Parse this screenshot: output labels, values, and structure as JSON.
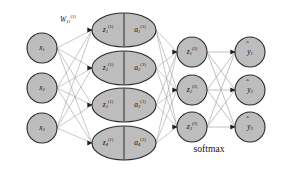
{
  "figure": {
    "type": "neural-network-diagram",
    "title": "",
    "annotations": {
      "weight_label": {
        "base": "W",
        "subscript": "11",
        "superscript": "(1)",
        "full": "W₁₁⁽¹⁾"
      },
      "softmax_label": "softmax"
    },
    "layers": [
      {
        "id": "input",
        "name": "input-layer",
        "shape": "circle",
        "nodes": [
          {
            "id": "x1",
            "base": "x",
            "subscript": "1",
            "superscript": "",
            "cx": 42,
            "cy": 48,
            "r": 15
          },
          {
            "id": "x2",
            "base": "x",
            "subscript": "2",
            "superscript": "",
            "cx": 42,
            "cy": 88,
            "r": 15
          },
          {
            "id": "x3",
            "base": "x",
            "subscript": "3",
            "superscript": "",
            "cx": 42,
            "cy": 128,
            "r": 15
          }
        ]
      },
      {
        "id": "hidden1",
        "name": "hidden-layer-1",
        "shape": "split-ellipse",
        "nodes": [
          {
            "id": "h1",
            "left_base": "z",
            "left_subscript": "1",
            "left_superscript": "(1)",
            "right_base": "a",
            "right_subscript": "1",
            "right_superscript": "(1)",
            "cx": 124,
            "cy": 30,
            "rx": 32,
            "ry": 17
          },
          {
            "id": "h2",
            "left_base": "z",
            "left_subscript": "2",
            "left_superscript": "(1)",
            "right_base": "a",
            "right_subscript": "2",
            "right_superscript": "(1)",
            "cx": 124,
            "cy": 68,
            "rx": 32,
            "ry": 17
          },
          {
            "id": "h3",
            "left_base": "z",
            "left_subscript": "3",
            "left_superscript": "(1)",
            "right_base": "a",
            "right_subscript": "3",
            "right_superscript": "(1)",
            "cx": 124,
            "cy": 105,
            "rx": 32,
            "ry": 17
          },
          {
            "id": "h4",
            "left_base": "z",
            "left_subscript": "4",
            "left_superscript": "(1)",
            "right_base": "a",
            "right_subscript": "4",
            "right_superscript": "(1)",
            "cx": 124,
            "cy": 143,
            "rx": 32,
            "ry": 17
          }
        ]
      },
      {
        "id": "hidden2",
        "name": "hidden-layer-2",
        "shape": "circle",
        "nodes": [
          {
            "id": "z1b",
            "base": "z",
            "subscript": "1",
            "superscript": "(2)",
            "cx": 192,
            "cy": 52,
            "r": 15
          },
          {
            "id": "z2b",
            "base": "z",
            "subscript": "2",
            "superscript": "(2)",
            "cx": 192,
            "cy": 90,
            "r": 15
          },
          {
            "id": "z3b",
            "base": "z",
            "subscript": "3",
            "superscript": "(2)",
            "cx": 192,
            "cy": 127,
            "r": 15
          }
        ]
      },
      {
        "id": "output",
        "name": "output-layer",
        "shape": "circle",
        "nodes": [
          {
            "id": "y1",
            "base": "y",
            "subscript": "1",
            "superscript": "",
            "hat": true,
            "cx": 250,
            "cy": 52,
            "r": 15
          },
          {
            "id": "y2",
            "base": "y",
            "subscript": "2",
            "superscript": "",
            "hat": true,
            "cx": 250,
            "cy": 90,
            "r": 15
          },
          {
            "id": "y3",
            "base": "y",
            "subscript": "3",
            "superscript": "",
            "hat": true,
            "cx": 250,
            "cy": 127,
            "r": 15
          }
        ]
      }
    ],
    "connections": [
      {
        "from_layer": "input",
        "to_layer": "hidden1",
        "pattern": "fully-connected",
        "count": 12
      },
      {
        "from_layer": "hidden1",
        "to_layer": "hidden2",
        "pattern": "fully-connected",
        "count": 12
      },
      {
        "from_layer": "hidden2",
        "to_layer": "output",
        "pattern": "one-to-one",
        "count": 3
      }
    ],
    "colors": {
      "node_fill": "#bdbdbd",
      "node_stroke": "#2b2b2b",
      "edge": "#9a9a9a",
      "arrowhead": "#1c1c1c",
      "background": "#ffffff",
      "text": "#111111"
    }
  }
}
